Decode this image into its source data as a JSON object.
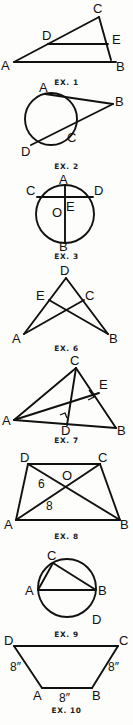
{
  "page": {
    "kind": "geometry-exercise-figures",
    "background_color": "#fdfdfb",
    "ink_color": "#111111",
    "figure_count": 8
  },
  "figures": [
    {
      "caption": "EX. 1",
      "description": "Triangle ABC with segment DE drawn parallel to base AB",
      "points": [
        {
          "label": "A",
          "x": 12,
          "y": 58
        },
        {
          "label": "B",
          "x": 118,
          "y": 58
        },
        {
          "label": "C",
          "x": 98,
          "y": 10
        },
        {
          "label": "D",
          "x": 46,
          "y": 37
        },
        {
          "label": "E",
          "x": 110,
          "y": 37
        }
      ],
      "segments": [
        "A-B",
        "A-C",
        "C-B",
        "D-E"
      ]
    },
    {
      "caption": "EX. 2",
      "description": "Circle with tangent AB from external point B and secant BD meeting circle at C",
      "points": [
        {
          "label": "A",
          "x": 42,
          "y": 92
        },
        {
          "label": "B",
          "x": 112,
          "y": 102
        },
        {
          "label": "C",
          "x": 70,
          "y": 134
        },
        {
          "label": "D",
          "x": 32,
          "y": 146
        }
      ],
      "segments": [
        "A-B",
        "B-D"
      ],
      "circle": {
        "cx": 51,
        "cy": 119,
        "r": 26
      }
    },
    {
      "caption": "EX. 3",
      "description": "Circle with center O, vertical diameter AB and horizontal chord CD intersecting at E",
      "points": [
        {
          "label": "A",
          "x": 66,
          "y": 182
        },
        {
          "label": "B",
          "x": 66,
          "y": 246
        },
        {
          "label": "C",
          "x": 34,
          "y": 196
        },
        {
          "label": "D",
          "x": 96,
          "y": 196
        },
        {
          "label": "O",
          "x": 59,
          "y": 214
        },
        {
          "label": "E",
          "x": 72,
          "y": 208
        }
      ],
      "segments": [
        "A-B",
        "C-D"
      ],
      "circle": {
        "cx": 65,
        "cy": 214,
        "r": 29
      }
    },
    {
      "caption": "EX. 6",
      "description": "Triangle D-A-B with cevians: E on DA, C on DB, segments EB and CA crossing",
      "points": [
        {
          "label": "D",
          "x": 66,
          "y": 272
        },
        {
          "label": "E",
          "x": 44,
          "y": 300
        },
        {
          "label": "C",
          "x": 86,
          "y": 300
        },
        {
          "label": "A",
          "x": 22,
          "y": 335
        },
        {
          "label": "B",
          "x": 110,
          "y": 335
        }
      ],
      "segments": [
        "D-A",
        "D-B",
        "E-B",
        "C-A"
      ]
    },
    {
      "caption": "EX. 7",
      "description": "Triangle ABC with altitude CD to AB and altitude AE to CB, right angle marks at D and E",
      "points": [
        {
          "label": "C",
          "x": 76,
          "y": 362
        },
        {
          "label": "A",
          "x": 14,
          "y": 420
        },
        {
          "label": "B",
          "x": 118,
          "y": 428
        },
        {
          "label": "D",
          "x": 66,
          "y": 428
        },
        {
          "label": "E",
          "x": 100,
          "y": 392
        }
      ],
      "segments": [
        "A-B",
        "A-C",
        "C-B",
        "C-D",
        "A-E"
      ],
      "right_angles": [
        "D",
        "E"
      ]
    },
    {
      "caption": "EX. 8",
      "description": "Trapezoid ABCD with diagonals AC and DB meeting at O; DO measures 6 and AO measures 8",
      "points": [
        {
          "label": "D",
          "x": 28,
          "y": 462
        },
        {
          "label": "C",
          "x": 100,
          "y": 462
        },
        {
          "label": "A",
          "x": 16,
          "y": 518
        },
        {
          "label": "B",
          "x": 120,
          "y": 518
        },
        {
          "label": "O",
          "x": 68,
          "y": 481
        }
      ],
      "segments": [
        "A-B",
        "B-C",
        "C-D",
        "D-A",
        "A-C",
        "D-B"
      ],
      "measures": [
        {
          "value": "6",
          "on": "D-O"
        },
        {
          "value": "8",
          "on": "A-O"
        }
      ]
    },
    {
      "caption": "EX. 9",
      "description": "Circle with diameter AB, inscribed chords AC and CB, point D on lower right arc",
      "points": [
        {
          "label": "A",
          "x": 33,
          "y": 590
        },
        {
          "label": "B",
          "x": 101,
          "y": 590
        },
        {
          "label": "C",
          "x": 50,
          "y": 562
        },
        {
          "label": "D",
          "x": 98,
          "y": 618
        }
      ],
      "segments": [
        "A-B",
        "A-C",
        "C-B"
      ],
      "circle": {
        "cx": 67,
        "cy": 588,
        "r": 29
      }
    },
    {
      "caption": "EX. 10",
      "description": "Isosceles trapezoid ABCD with legs AD and BC each 8 inches and base AB 8 inches",
      "points": [
        {
          "label": "D",
          "x": 12,
          "y": 644
        },
        {
          "label": "C",
          "x": 120,
          "y": 644
        },
        {
          "label": "A",
          "x": 40,
          "y": 690
        },
        {
          "label": "B",
          "x": 94,
          "y": 690
        }
      ],
      "segments": [
        "D-C",
        "D-A",
        "A-B",
        "B-C"
      ],
      "measures": [
        {
          "value": "8″",
          "on": "D-A"
        },
        {
          "value": "8″",
          "on": "C-B"
        },
        {
          "value": "8″",
          "on": "A-B"
        }
      ]
    }
  ]
}
